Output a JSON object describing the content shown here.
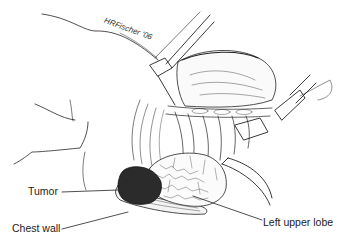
{
  "figure": {
    "signature": "HRFischer '06",
    "labels": {
      "tumor": "Tumor",
      "chest_wall": "Chest wall",
      "left_upper_lobe": "Left upper lobe"
    },
    "colors": {
      "ink": "#222222",
      "tumor_fill": "#2b2b2b",
      "background": "#ffffff"
    }
  }
}
